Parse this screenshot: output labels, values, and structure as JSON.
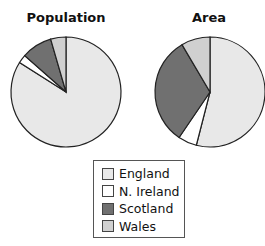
{
  "chart_data": [
    {
      "type": "pie",
      "title": "Population",
      "categories": [
        "England",
        "N. Ireland",
        "Scotland",
        "Wales"
      ],
      "values": [
        84,
        2.5,
        9,
        4.5
      ],
      "start_angle_deg": 0,
      "direction": "clockwise"
    },
    {
      "type": "pie",
      "title": "Area",
      "categories": [
        "England",
        "N. Ireland",
        "Scotland",
        "Wales"
      ],
      "values": [
        54,
        5.5,
        32,
        8.5
      ],
      "start_angle_deg": 0,
      "direction": "clockwise"
    }
  ],
  "legend": {
    "position": "bottom-center",
    "items": [
      {
        "label": "England",
        "color": "#e8e8e8"
      },
      {
        "label": "N. Ireland",
        "color": "#ffffff"
      },
      {
        "label": "Scotland",
        "color": "#707070"
      },
      {
        "label": "Wales",
        "color": "#d0d0d0"
      }
    ]
  }
}
